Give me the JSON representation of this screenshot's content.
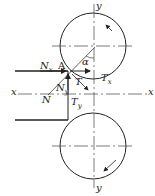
{
  "diagram": {
    "type": "rolling mill force analysis",
    "labels": {
      "y_top": "y",
      "y_bottom": "y",
      "x_left": "x",
      "x_right": "x",
      "point_a": "A",
      "alpha": "α",
      "nx": "N",
      "nx_sub": "x",
      "ny": "N",
      "ny_sub": "y",
      "n": "N",
      "t": "T",
      "tx": "T",
      "tx_sub": "x",
      "ty": "T",
      "ty_sub": "y"
    },
    "colors": {
      "stroke": "#222222",
      "background": "#ffffff"
    }
  }
}
